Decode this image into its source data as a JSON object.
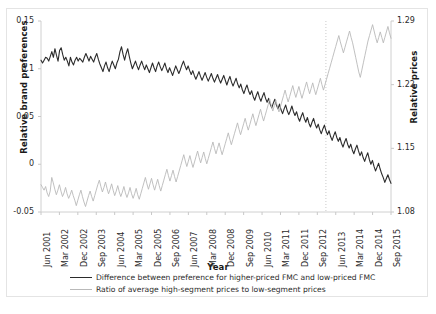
{
  "chart_data": {
    "type": "line",
    "title": "",
    "xlabel": "Year",
    "ylabel": "Relative brand preferences",
    "ylabel_right": "Relative prices",
    "grid": false,
    "legend_position": "bottom",
    "ylim": [
      -0.05,
      0.15
    ],
    "ylim_right": [
      1.08,
      1.29
    ],
    "yticks": [
      "0.15",
      "0.1",
      "0.05",
      "0",
      "-0.05"
    ],
    "ytick_values": [
      0.15,
      0.1,
      0.05,
      0,
      -0.05
    ],
    "yticks_right": [
      "1.29",
      "1.22",
      "1.15",
      "1.08"
    ],
    "ytick_values_right": [
      1.29,
      1.22,
      1.15,
      1.08
    ],
    "xticks": [
      "Jun 2001",
      "Mar 2002",
      "Dec 2002",
      "Sep 2003",
      "Jun 2004",
      "Mar 2005",
      "Dec 2005",
      "Sep 2006",
      "Jun 2007",
      "Mar 2008",
      "Dec 2008",
      "Sep 2009",
      "Jun 2010",
      "Mar 2011",
      "Dec 2011",
      "Sep 2012",
      "Jun 2013",
      "Mar 2014",
      "Dec 2014",
      "Sep 2015"
    ],
    "annotations": [
      {
        "type": "vertical-dotted-line",
        "x_label": "Jan 2012",
        "x_fraction": 0.814
      }
    ],
    "series": [
      {
        "name": "Difference between preference for higher-priced FMC and low-priced FMC",
        "axis": "left",
        "color": "#2b2b2b",
        "width": 1.1,
        "values": [
          0.109,
          0.106,
          0.109,
          0.112,
          0.111,
          0.108,
          0.113,
          0.118,
          0.112,
          0.121,
          0.114,
          0.108,
          0.119,
          0.122,
          0.115,
          0.109,
          0.112,
          0.108,
          0.103,
          0.112,
          0.107,
          0.104,
          0.109,
          0.112,
          0.108,
          0.111,
          0.109,
          0.107,
          0.112,
          0.116,
          0.112,
          0.108,
          0.113,
          0.11,
          0.107,
          0.112,
          0.116,
          0.11,
          0.105,
          0.101,
          0.097,
          0.103,
          0.107,
          0.101,
          0.097,
          0.103,
          0.108,
          0.104,
          0.1,
          0.106,
          0.11,
          0.118,
          0.123,
          0.115,
          0.109,
          0.116,
          0.121,
          0.113,
          0.106,
          0.1,
          0.104,
          0.108,
          0.103,
          0.099,
          0.104,
          0.108,
          0.103,
          0.099,
          0.104,
          0.1,
          0.096,
          0.101,
          0.106,
          0.101,
          0.097,
          0.103,
          0.107,
          0.102,
          0.098,
          0.102,
          0.106,
          0.1,
          0.096,
          0.101,
          0.097,
          0.093,
          0.098,
          0.103,
          0.099,
          0.095,
          0.099,
          0.104,
          0.108,
          0.103,
          0.099,
          0.103,
          0.098,
          0.094,
          0.098,
          0.093,
          0.089,
          0.093,
          0.097,
          0.092,
          0.088,
          0.092,
          0.096,
          0.091,
          0.087,
          0.091,
          0.095,
          0.09,
          0.086,
          0.09,
          0.094,
          0.089,
          0.085,
          0.089,
          0.093,
          0.088,
          0.083,
          0.088,
          0.092,
          0.086,
          0.082,
          0.086,
          0.09,
          0.084,
          0.08,
          0.084,
          0.078,
          0.074,
          0.079,
          0.083,
          0.077,
          0.073,
          0.077,
          0.071,
          0.067,
          0.072,
          0.076,
          0.07,
          0.066,
          0.071,
          0.075,
          0.069,
          0.065,
          0.069,
          0.063,
          0.059,
          0.064,
          0.068,
          0.062,
          0.058,
          0.063,
          0.057,
          0.053,
          0.058,
          0.062,
          0.056,
          0.052,
          0.056,
          0.061,
          0.055,
          0.051,
          0.055,
          0.049,
          0.045,
          0.05,
          0.054,
          0.048,
          0.044,
          0.049,
          0.043,
          0.039,
          0.044,
          0.048,
          0.042,
          0.038,
          0.042,
          0.036,
          0.032,
          0.037,
          0.041,
          0.035,
          0.031,
          0.035,
          0.029,
          0.025,
          0.03,
          0.034,
          0.028,
          0.024,
          0.028,
          0.022,
          0.018,
          0.023,
          0.027,
          0.021,
          0.017,
          0.021,
          0.015,
          0.011,
          0.016,
          0.02,
          0.014,
          0.009,
          0.013,
          0.007,
          0.003,
          0.008,
          0.012,
          0.005,
          0.0,
          0.004,
          -0.002,
          -0.007,
          -0.003,
          0.001,
          -0.005,
          -0.01,
          -0.014,
          -0.019,
          -0.015,
          -0.011,
          -0.016,
          -0.02
        ]
      },
      {
        "name": "Ratio of average high-segment prices to low-segment prices",
        "axis": "right",
        "color": "#b9b9b9",
        "width": 0.9,
        "values": [
          1.11,
          1.107,
          1.104,
          1.108,
          1.101,
          1.097,
          1.103,
          1.118,
          1.112,
          1.105,
          1.099,
          1.104,
          1.11,
          1.103,
          1.097,
          1.101,
          1.107,
          1.1,
          1.095,
          1.099,
          1.104,
          1.098,
          1.093,
          1.087,
          1.093,
          1.099,
          1.104,
          1.097,
          1.091,
          1.086,
          1.092,
          1.098,
          1.103,
          1.097,
          1.092,
          1.098,
          1.104,
          1.11,
          1.115,
          1.108,
          1.102,
          1.107,
          1.113,
          1.106,
          1.1,
          1.105,
          1.111,
          1.104,
          1.098,
          1.103,
          1.109,
          1.102,
          1.097,
          1.102,
          1.108,
          1.101,
          1.096,
          1.101,
          1.107,
          1.1,
          1.095,
          1.1,
          1.106,
          1.099,
          1.094,
          1.1,
          1.106,
          1.112,
          1.118,
          1.111,
          1.105,
          1.111,
          1.117,
          1.11,
          1.104,
          1.11,
          1.116,
          1.109,
          1.103,
          1.109,
          1.115,
          1.121,
          1.127,
          1.12,
          1.114,
          1.12,
          1.126,
          1.119,
          1.113,
          1.119,
          1.125,
          1.131,
          1.137,
          1.143,
          1.136,
          1.13,
          1.136,
          1.142,
          1.135,
          1.129,
          1.135,
          1.141,
          1.147,
          1.14,
          1.134,
          1.14,
          1.146,
          1.139,
          1.133,
          1.139,
          1.145,
          1.151,
          1.157,
          1.15,
          1.144,
          1.15,
          1.156,
          1.149,
          1.143,
          1.149,
          1.155,
          1.161,
          1.167,
          1.16,
          1.154,
          1.16,
          1.166,
          1.172,
          1.178,
          1.171,
          1.165,
          1.171,
          1.177,
          1.183,
          1.176,
          1.17,
          1.176,
          1.182,
          1.188,
          1.181,
          1.175,
          1.181,
          1.187,
          1.193,
          1.186,
          1.18,
          1.186,
          1.192,
          1.198,
          1.204,
          1.197,
          1.191,
          1.197,
          1.203,
          1.196,
          1.19,
          1.196,
          1.202,
          1.208,
          1.214,
          1.207,
          1.201,
          1.207,
          1.213,
          1.219,
          1.212,
          1.206,
          1.212,
          1.218,
          1.211,
          1.205,
          1.211,
          1.217,
          1.223,
          1.216,
          1.21,
          1.216,
          1.222,
          1.215,
          1.209,
          1.215,
          1.221,
          1.227,
          1.22,
          1.214,
          1.22,
          1.226,
          1.232,
          1.238,
          1.244,
          1.25,
          1.256,
          1.262,
          1.268,
          1.274,
          1.267,
          1.261,
          1.255,
          1.261,
          1.267,
          1.273,
          1.279,
          1.272,
          1.266,
          1.258,
          1.25,
          1.242,
          1.234,
          1.228,
          1.236,
          1.244,
          1.252,
          1.26,
          1.268,
          1.274,
          1.28,
          1.286,
          1.279,
          1.272,
          1.266,
          1.272,
          1.278,
          1.272,
          1.266,
          1.272,
          1.278,
          1.284,
          1.277,
          1.271
        ]
      }
    ]
  }
}
